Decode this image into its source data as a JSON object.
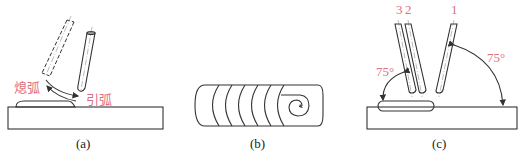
{
  "figure": {
    "panels": [
      {
        "id": "a",
        "caption": "(a)",
        "labels": {
          "extinguish_arc": "熄弧",
          "strike_arc": "引弧"
        }
      },
      {
        "id": "b",
        "caption": "(b)"
      },
      {
        "id": "c",
        "caption": "(c)",
        "labels": {
          "electrode_3": "3",
          "electrode_2": "2",
          "electrode_1": "1",
          "angle_left": "75°",
          "angle_right": "75°"
        }
      }
    ],
    "colors": {
      "label_red": "#e0707f",
      "line": "#333333",
      "background": "#ffffff"
    }
  }
}
